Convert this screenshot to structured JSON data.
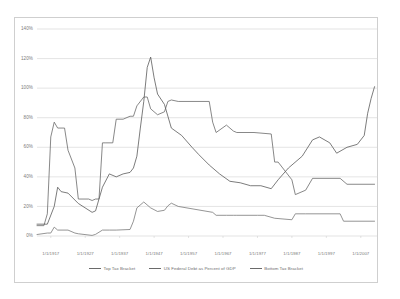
{
  "chart_data": {
    "type": "line",
    "title": "",
    "subtitle": "",
    "xlabel": "",
    "ylabel": "",
    "grid": true,
    "legend_position": "bottom",
    "ylim": [
      0,
      140
    ],
    "xlim": [
      1913,
      2012
    ],
    "y_ticks": [
      "0%",
      "20%",
      "40%",
      "60%",
      "80%",
      "100%",
      "120%",
      "140%"
    ],
    "y_tick_values": [
      0,
      20,
      40,
      60,
      80,
      100,
      120,
      140
    ],
    "x_ticks": [
      "1/1/1917",
      "1/1/1927",
      "1/1/1937",
      "1/1/1947",
      "1/1/1957",
      "1/1/1967",
      "1/1/1977",
      "1/1/1987",
      "1/1/1997",
      "1/1/2007"
    ],
    "x_tick_values": [
      1917,
      1927,
      1937,
      1947,
      1957,
      1967,
      1977,
      1987,
      1997,
      2007
    ],
    "series": [
      {
        "name": "Top Tax Bracket",
        "color": "#6a6a6a",
        "x": [
          1913,
          1915,
          1916,
          1917,
          1918,
          1919,
          1921,
          1922,
          1924,
          1925,
          1928,
          1929,
          1930,
          1931,
          1932,
          1933,
          1935,
          1936,
          1938,
          1940,
          1941,
          1942,
          1944,
          1945,
          1946,
          1948,
          1950,
          1951,
          1952,
          1954,
          1963,
          1964,
          1965,
          1968,
          1970,
          1971,
          1976,
          1981,
          1982,
          1983,
          1987,
          1988,
          1991,
          1993,
          2001,
          2003,
          2011
        ],
        "y": [
          7,
          7,
          15,
          67,
          77,
          73,
          73,
          58,
          46,
          25,
          25,
          24,
          25,
          25,
          63,
          63,
          63,
          79,
          79,
          81,
          81,
          88,
          94,
          94,
          86,
          82,
          84,
          91,
          92,
          91,
          91,
          77,
          70,
          75,
          71,
          70,
          70,
          69,
          50,
          50,
          38,
          28,
          31,
          39,
          39,
          35,
          35
        ]
      },
      {
        "name": "US Federal Debt as Percent of GDP",
        "color": "#5a5a5a",
        "x": [
          1913,
          1916,
          1918,
          1919,
          1920,
          1922,
          1925,
          1929,
          1930,
          1932,
          1934,
          1936,
          1938,
          1940,
          1941,
          1942,
          1943,
          1944,
          1945,
          1946,
          1947,
          1948,
          1950,
          1952,
          1955,
          1958,
          1960,
          1963,
          1966,
          1969,
          1972,
          1975,
          1978,
          1981,
          1983,
          1986,
          1990,
          1993,
          1995,
          1998,
          2000,
          2003,
          2006,
          2008,
          2009,
          2010,
          2011
        ],
        "y": [
          8,
          8,
          20,
          33,
          30,
          29,
          22,
          16,
          17,
          33,
          42,
          40,
          42,
          43,
          46,
          54,
          73,
          91,
          114,
          121,
          107,
          96,
          89,
          73,
          68,
          60,
          55,
          48,
          42,
          37,
          36,
          34,
          34,
          32,
          38,
          46,
          54,
          65,
          67,
          63,
          56,
          60,
          62,
          68,
          83,
          93,
          101
        ]
      },
      {
        "name": "Bottom Tax Bracket",
        "color": "#7a7a7a",
        "x": [
          1913,
          1916,
          1917,
          1918,
          1919,
          1922,
          1924,
          1925,
          1929,
          1930,
          1932,
          1934,
          1936,
          1940,
          1941,
          1942,
          1944,
          1946,
          1948,
          1950,
          1951,
          1952,
          1954,
          1964,
          1965,
          1968,
          1970,
          1971,
          1977,
          1979,
          1982,
          1987,
          1988,
          1991,
          2001,
          2002,
          2003,
          2011
        ],
        "y": [
          1,
          2,
          2,
          6,
          4,
          4,
          2,
          1.5,
          0.4,
          1.1,
          4,
          4,
          4,
          4.4,
          10,
          19,
          23,
          19,
          16.6,
          17.4,
          20.4,
          22.2,
          20,
          16,
          14,
          14,
          14,
          14,
          14,
          14,
          12,
          11,
          15,
          15,
          15,
          10,
          10,
          10
        ]
      }
    ]
  },
  "legend": {
    "items": [
      {
        "label": "Top Tax Bracket"
      },
      {
        "label": "US Federal Debt as Percent of GDP"
      },
      {
        "label": "Bottom Tax Bracket"
      }
    ]
  }
}
